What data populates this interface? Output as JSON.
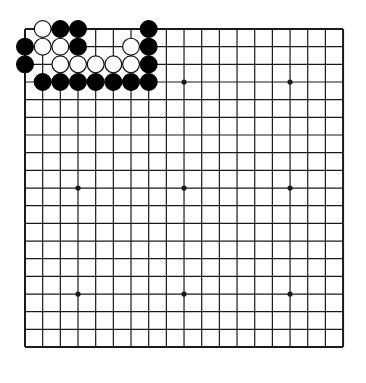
{
  "board": {
    "size": 19,
    "origin_x": 25,
    "origin_y": 29,
    "spacing": 17.67,
    "line_color": "#1a1a1a",
    "background": "#ffffff",
    "star_points": [
      [
        3,
        3
      ],
      [
        9,
        3
      ],
      [
        15,
        3
      ],
      [
        3,
        9
      ],
      [
        9,
        9
      ],
      [
        15,
        9
      ],
      [
        3,
        15
      ],
      [
        9,
        15
      ],
      [
        15,
        15
      ]
    ],
    "stones": [
      {
        "color": "white",
        "col": 1,
        "row": 0
      },
      {
        "color": "black",
        "col": 2,
        "row": 0
      },
      {
        "color": "black",
        "col": 3,
        "row": 0
      },
      {
        "color": "black",
        "col": 7,
        "row": 0
      },
      {
        "color": "black",
        "col": 0,
        "row": 1
      },
      {
        "color": "white",
        "col": 1,
        "row": 1
      },
      {
        "color": "white",
        "col": 2,
        "row": 1
      },
      {
        "color": "black",
        "col": 3,
        "row": 1
      },
      {
        "color": "white",
        "col": 6,
        "row": 1
      },
      {
        "color": "black",
        "col": 7,
        "row": 1
      },
      {
        "color": "black",
        "col": 0,
        "row": 2
      },
      {
        "color": "white",
        "col": 2,
        "row": 2
      },
      {
        "color": "white",
        "col": 3,
        "row": 2
      },
      {
        "color": "white",
        "col": 4,
        "row": 2
      },
      {
        "color": "white",
        "col": 5,
        "row": 2
      },
      {
        "color": "white",
        "col": 6,
        "row": 2
      },
      {
        "color": "black",
        "col": 7,
        "row": 2
      },
      {
        "color": "black",
        "col": 1,
        "row": 3
      },
      {
        "color": "black",
        "col": 2,
        "row": 3
      },
      {
        "color": "black",
        "col": 3,
        "row": 3
      },
      {
        "color": "black",
        "col": 4,
        "row": 3
      },
      {
        "color": "black",
        "col": 5,
        "row": 3
      },
      {
        "color": "black",
        "col": 6,
        "row": 3
      },
      {
        "color": "black",
        "col": 7,
        "row": 3
      }
    ]
  }
}
